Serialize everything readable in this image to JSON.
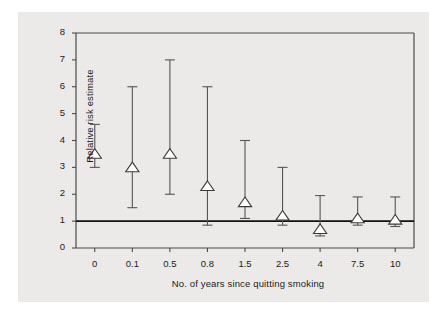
{
  "figure": {
    "background_color": "#ffffff",
    "panel_color": "#eeedec",
    "axis_color": "#4a4a4a",
    "reference_line_color": "#111111",
    "marker_edge_color": "#3a3a3a",
    "marker_fill_color": "#ffffff",
    "errorbar_color": "#555555"
  },
  "chart_data": {
    "type": "scatter",
    "title": "",
    "subtitle": "",
    "xlabel": "No. of years since quitting smoking",
    "ylabel": "Relative risk estimate",
    "categories": [
      "0",
      "0.1",
      "0.5",
      "0.8",
      "1.5",
      "2.5",
      "4",
      "7.5",
      "10"
    ],
    "xtick_labels": [
      "0",
      "0.1",
      "0.5",
      "0.8",
      "1.5",
      "2.5",
      "4",
      "7.5",
      "10"
    ],
    "ytick_labels": [
      "0",
      "1",
      "2",
      "3",
      "4",
      "5",
      "6",
      "7",
      "8"
    ],
    "ylim": [
      0,
      8
    ],
    "yticks": [
      0,
      1,
      2,
      3,
      4,
      5,
      6,
      7,
      8
    ],
    "grid": false,
    "legend": null,
    "legend_position": "none",
    "reference_line": {
      "y": 1,
      "label": "null value (RR = 1)"
    },
    "marker_style": "open-triangle-up",
    "errorbar_style": "capped-vertical",
    "values": [
      3.5,
      3.0,
      3.5,
      2.3,
      1.7,
      1.2,
      0.7,
      1.1,
      1.05
    ],
    "errorbar_lower": [
      3.0,
      1.5,
      2.0,
      0.85,
      1.1,
      0.85,
      0.45,
      0.85,
      0.8
    ],
    "errorbar_upper": [
      4.6,
      6.0,
      7.0,
      6.0,
      4.0,
      3.0,
      1.95,
      1.9,
      1.9
    ],
    "series": [
      {
        "name": "Relative risk estimate",
        "points": [
          {
            "x_label": "0",
            "value": 3.5,
            "ci_low": 3.0,
            "ci_high": 4.6
          },
          {
            "x_label": "0.1",
            "value": 3.0,
            "ci_low": 1.5,
            "ci_high": 6.0
          },
          {
            "x_label": "0.5",
            "value": 3.5,
            "ci_low": 2.0,
            "ci_high": 7.0
          },
          {
            "x_label": "0.8",
            "value": 2.3,
            "ci_low": 0.85,
            "ci_high": 6.0
          },
          {
            "x_label": "1.5",
            "value": 1.7,
            "ci_low": 1.1,
            "ci_high": 4.0
          },
          {
            "x_label": "2.5",
            "value": 1.2,
            "ci_low": 0.85,
            "ci_high": 3.0
          },
          {
            "x_label": "4",
            "value": 0.7,
            "ci_low": 0.45,
            "ci_high": 1.95
          },
          {
            "x_label": "7.5",
            "value": 1.1,
            "ci_low": 0.85,
            "ci_high": 1.9
          },
          {
            "x_label": "10",
            "value": 1.05,
            "ci_low": 0.8,
            "ci_high": 1.9
          }
        ]
      }
    ]
  }
}
